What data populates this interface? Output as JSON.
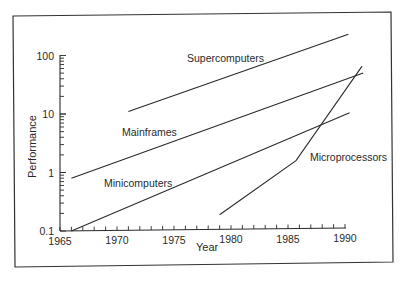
{
  "chart_data": {
    "type": "line",
    "title": "",
    "xlabel": "Year",
    "ylabel": "Performance",
    "xlim": [
      1965,
      1990
    ],
    "ylim": [
      0.1,
      100
    ],
    "yscale": "log",
    "grid": false,
    "legend": "inline labels",
    "x_ticks": [
      1965,
      1970,
      1975,
      1980,
      1985,
      1990
    ],
    "x_tick_labels": [
      "1965",
      "1970",
      "1975",
      "1980",
      "1985",
      "1990"
    ],
    "y_ticks": [
      0.1,
      1,
      10,
      100
    ],
    "y_tick_labels": [
      "0.1",
      "1",
      "10",
      "100"
    ],
    "series": [
      {
        "name": "Supercomputers",
        "x": [
          1971,
          1990.3
        ],
        "y": [
          11,
          230
        ]
      },
      {
        "name": "Mainframes",
        "x": [
          1966,
          1991.6
        ],
        "y": [
          0.8,
          50
        ]
      },
      {
        "name": "Minicomputers",
        "x": [
          1966,
          1990.4
        ],
        "y": [
          0.1,
          10.5
        ]
      },
      {
        "name": "Microprocessors",
        "x": [
          1979,
          1985.7,
          1991.5
        ],
        "y": [
          0.19,
          1.6,
          66
        ]
      }
    ]
  },
  "labels": {
    "supercomputers": "Supercomputers",
    "mainframes": "Mainframes",
    "minicomputers": "Minicomputers",
    "microprocessors": "Microprocessors",
    "xlabel": "Year",
    "ylabel": "Performance"
  },
  "colors": {
    "line": "#2a2a2a",
    "frame": "#333333",
    "background": "#ffffff"
  }
}
